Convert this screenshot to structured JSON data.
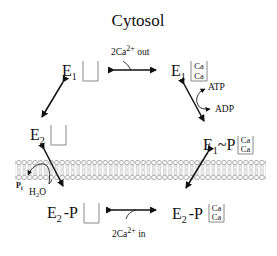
{
  "title": "Cytosol",
  "states": {
    "e1_empty": {
      "enzyme": "E",
      "sub": "1",
      "suffix": "",
      "bound": []
    },
    "e1_ca": {
      "enzyme": "E",
      "sub": "1",
      "suffix": "",
      "bound": [
        "Ca",
        "Ca"
      ]
    },
    "e1p_ca": {
      "enzyme": "E",
      "sub": "1",
      "suffix": "~P",
      "bound": [
        "Ca",
        "Ca"
      ]
    },
    "e2p_ca": {
      "enzyme": "E",
      "sub": "2",
      "suffix": "-P",
      "bound": [
        "Ca",
        "Ca"
      ]
    },
    "e2p_empty": {
      "enzyme": "E",
      "sub": "2",
      "suffix": "-P",
      "bound": []
    },
    "e2_empty": {
      "enzyme": "E",
      "sub": "2",
      "suffix": "",
      "bound": []
    }
  },
  "transitions": {
    "top": {
      "label_prefix": "2Ca",
      "label_sup": "2+",
      "label_suffix": " out"
    },
    "right": {
      "in": "ATP",
      "out": "ADP"
    },
    "bottom": {
      "label_prefix": "2Ca",
      "label_sup": "2+",
      "label_suffix": " in"
    },
    "left": {
      "in": "H",
      "in_sub": "2",
      "in_tail": "O",
      "out": "P",
      "out_sub": "i"
    }
  },
  "membrane": {
    "label": "lipid-bilayer",
    "colors": {
      "head_stroke": "#777777",
      "tail": "#888888"
    }
  }
}
